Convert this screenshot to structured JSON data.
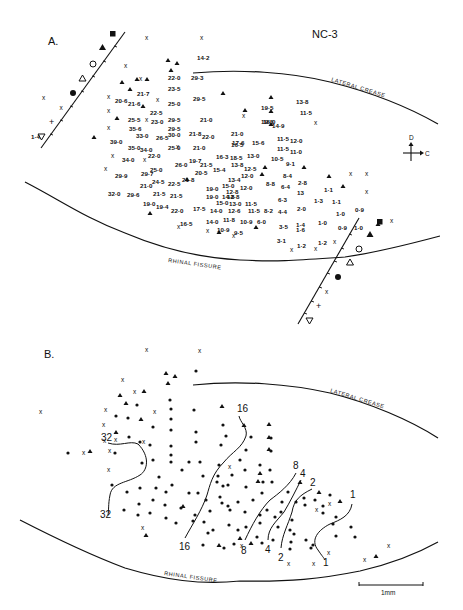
{
  "figure": {
    "id_label": "NC-3",
    "panels": [
      {
        "label": "A.",
        "landmarks": [
          "LATERAL CREASE",
          "RHINAL FISSURE"
        ],
        "orientation": {
          "up": "D",
          "right": "C"
        },
        "electrode_track_markers": [
          "filled-square",
          "filled-triangle",
          "open-circle",
          "open-triangle",
          "filled-circle",
          "x",
          "+",
          "open-inverted-triangle"
        ],
        "point_legend": {
          "x": "unresponsive site",
          "A": "auditory-responsive site"
        }
      },
      {
        "label": "B.",
        "landmarks": [
          "LATERAL CREASE",
          "RHINAL FISSURE"
        ],
        "isofrequency_labels": [
          "32",
          "16",
          "8",
          "4",
          "2",
          "1"
        ],
        "scale_bar": "1mm"
      }
    ]
  },
  "panelA": {
    "label": "A.",
    "title": "NC-3",
    "lateral_crease": "LATERAL CREASE",
    "rhinal_fissure": "RHINAL FISSURE",
    "orient_d": "D",
    "orient_c": "C",
    "values": [
      {
        "x": 197,
        "y": 60,
        "t": "14·2"
      },
      {
        "x": 168,
        "y": 80,
        "t": "22·0"
      },
      {
        "x": 191,
        "y": 80,
        "t": "29·3"
      },
      {
        "x": 168,
        "y": 91,
        "t": "23·5"
      },
      {
        "x": 137,
        "y": 96,
        "t": "21·7"
      },
      {
        "x": 115,
        "y": 103,
        "t": "20·6"
      },
      {
        "x": 128,
        "y": 106,
        "t": "21·6"
      },
      {
        "x": 168,
        "y": 106,
        "t": "25·0"
      },
      {
        "x": 193,
        "y": 101,
        "t": "29·5"
      },
      {
        "x": 150,
        "y": 115,
        "t": "22·5"
      },
      {
        "x": 261,
        "y": 110,
        "t": "19·5"
      },
      {
        "x": 296,
        "y": 104,
        "t": "13·8"
      },
      {
        "x": 128,
        "y": 122,
        "t": "25·5"
      },
      {
        "x": 151,
        "y": 124,
        "t": "23·0"
      },
      {
        "x": 168,
        "y": 122,
        "t": "29·5"
      },
      {
        "x": 200,
        "y": 122,
        "t": "21·0"
      },
      {
        "x": 261,
        "y": 124,
        "t": "19·5"
      },
      {
        "x": 300,
        "y": 115,
        "t": "11·5"
      },
      {
        "x": 168,
        "y": 131,
        "t": "29·5"
      },
      {
        "x": 129,
        "y": 131,
        "t": "35·6"
      },
      {
        "x": 136,
        "y": 138,
        "t": "33·0"
      },
      {
        "x": 156,
        "y": 140,
        "t": "26·5"
      },
      {
        "x": 168,
        "y": 137,
        "t": "30·0"
      },
      {
        "x": 189,
        "y": 136,
        "t": "21·8"
      },
      {
        "x": 202,
        "y": 139,
        "t": "22·0"
      },
      {
        "x": 231,
        "y": 136,
        "t": "21·0"
      },
      {
        "x": 263,
        "y": 124,
        "t": "18·0"
      },
      {
        "x": 272,
        "y": 128,
        "t": "14·9"
      },
      {
        "x": 110,
        "y": 144,
        "t": "39·0"
      },
      {
        "x": 232,
        "y": 145,
        "t": "17·6"
      },
      {
        "x": 252,
        "y": 145,
        "t": "15·6"
      },
      {
        "x": 277,
        "y": 141,
        "t": "11·5"
      },
      {
        "x": 290,
        "y": 143,
        "t": "12·0"
      },
      {
        "x": 128,
        "y": 150,
        "t": "35·0"
      },
      {
        "x": 140,
        "y": 152,
        "t": "34·0"
      },
      {
        "x": 168,
        "y": 150,
        "t": "25·0"
      },
      {
        "x": 193,
        "y": 150,
        "t": "21·0"
      },
      {
        "x": 231,
        "y": 147,
        "t": "16·5"
      },
      {
        "x": 277,
        "y": 151,
        "t": "11·5"
      },
      {
        "x": 290,
        "y": 154,
        "t": "11·0"
      },
      {
        "x": 148,
        "y": 158,
        "t": "22·0"
      },
      {
        "x": 122,
        "y": 162,
        "t": "34·0"
      },
      {
        "x": 216,
        "y": 159,
        "t": "16·3"
      },
      {
        "x": 230,
        "y": 160,
        "t": "18·5"
      },
      {
        "x": 247,
        "y": 158,
        "t": "13·0"
      },
      {
        "x": 189,
        "y": 163,
        "t": "19·7"
      },
      {
        "x": 175,
        "y": 167,
        "t": "26·0"
      },
      {
        "x": 200,
        "y": 167,
        "t": "21·5"
      },
      {
        "x": 271,
        "y": 161,
        "t": "10·5"
      },
      {
        "x": 286,
        "y": 166,
        "t": "9·1"
      },
      {
        "x": 150,
        "y": 172,
        "t": "25·0"
      },
      {
        "x": 231,
        "y": 167,
        "t": "13·8"
      },
      {
        "x": 244,
        "y": 171,
        "t": "12·5"
      },
      {
        "x": 115,
        "y": 178,
        "t": "29·9"
      },
      {
        "x": 141,
        "y": 176,
        "t": "29·7"
      },
      {
        "x": 213,
        "y": 172,
        "t": "15·4"
      },
      {
        "x": 195,
        "y": 175,
        "t": "20·5"
      },
      {
        "x": 241,
        "y": 178,
        "t": "12·0"
      },
      {
        "x": 283,
        "y": 178,
        "t": "8·4"
      },
      {
        "x": 152,
        "y": 184,
        "t": "24·5"
      },
      {
        "x": 168,
        "y": 186,
        "t": "22·5"
      },
      {
        "x": 182,
        "y": 182,
        "t": "21·8"
      },
      {
        "x": 228,
        "y": 182,
        "t": "13·4"
      },
      {
        "x": 298,
        "y": 185,
        "t": "2·8"
      },
      {
        "x": 140,
        "y": 188,
        "t": "21·0"
      },
      {
        "x": 206,
        "y": 191,
        "t": "19·0"
      },
      {
        "x": 222,
        "y": 188,
        "t": "15·0"
      },
      {
        "x": 240,
        "y": 190,
        "t": "12·0"
      },
      {
        "x": 226,
        "y": 194,
        "t": "12·8"
      },
      {
        "x": 266,
        "y": 186,
        "t": "8·8"
      },
      {
        "x": 281,
        "y": 189,
        "t": "6·4"
      },
      {
        "x": 108,
        "y": 196,
        "t": "32·0"
      },
      {
        "x": 127,
        "y": 197,
        "t": "29·6"
      },
      {
        "x": 153,
        "y": 196,
        "t": "21·5"
      },
      {
        "x": 170,
        "y": 198,
        "t": "21·5"
      },
      {
        "x": 206,
        "y": 199,
        "t": "19·0"
      },
      {
        "x": 222,
        "y": 199,
        "t": "14·8"
      },
      {
        "x": 227,
        "y": 199,
        "t": "12·8"
      },
      {
        "x": 297,
        "y": 195,
        "t": "13"
      },
      {
        "x": 143,
        "y": 206,
        "t": "19·0"
      },
      {
        "x": 156,
        "y": 209,
        "t": "19·4"
      },
      {
        "x": 216,
        "y": 205,
        "t": "15·0"
      },
      {
        "x": 229,
        "y": 206,
        "t": "13·0"
      },
      {
        "x": 245,
        "y": 206,
        "t": "11·5"
      },
      {
        "x": 278,
        "y": 202,
        "t": "6·3"
      },
      {
        "x": 171,
        "y": 213,
        "t": "22·0"
      },
      {
        "x": 193,
        "y": 211,
        "t": "17·5"
      },
      {
        "x": 210,
        "y": 213,
        "t": "14·0"
      },
      {
        "x": 228,
        "y": 213,
        "t": "12·6"
      },
      {
        "x": 248,
        "y": 213,
        "t": "11·5"
      },
      {
        "x": 264,
        "y": 213,
        "t": "8·2"
      },
      {
        "x": 278,
        "y": 214,
        "t": "4·4"
      },
      {
        "x": 297,
        "y": 211,
        "t": "2·0"
      },
      {
        "x": 180,
        "y": 226,
        "t": "16·5"
      },
      {
        "x": 206,
        "y": 224,
        "t": "14·0"
      },
      {
        "x": 223,
        "y": 222,
        "t": "11·8"
      },
      {
        "x": 240,
        "y": 224,
        "t": "10·9"
      },
      {
        "x": 257,
        "y": 224,
        "t": "6·0"
      },
      {
        "x": 217,
        "y": 232,
        "t": "10·9"
      },
      {
        "x": 234,
        "y": 235,
        "t": "9·5"
      },
      {
        "x": 279,
        "y": 229,
        "t": "3·5"
      },
      {
        "x": 296,
        "y": 227,
        "t": "1·4"
      },
      {
        "x": 296,
        "y": 232,
        "t": "1·6"
      },
      {
        "x": 277,
        "y": 243,
        "t": "3·1"
      },
      {
        "x": 297,
        "y": 248,
        "t": "1·2"
      },
      {
        "x": 318,
        "y": 245,
        "t": "1·2"
      },
      {
        "x": 318,
        "y": 225,
        "t": "1·0"
      },
      {
        "x": 336,
        "y": 216,
        "t": "1·0"
      },
      {
        "x": 338,
        "y": 230,
        "t": "0·9"
      },
      {
        "x": 355,
        "y": 212,
        "t": "0·9"
      },
      {
        "x": 354,
        "y": 230,
        "t": "1·0"
      },
      {
        "x": 324,
        "y": 192,
        "t": "1·1"
      },
      {
        "x": 314,
        "y": 203,
        "t": "1·3"
      },
      {
        "x": 332,
        "y": 204,
        "t": "1·1"
      },
      {
        "x": 31,
        "y": 139,
        "t": "1·4"
      }
    ],
    "x_marks": [
      [
        145,
        40
      ],
      [
        200,
        40
      ],
      [
        42,
        100
      ],
      [
        124,
        68
      ],
      [
        139,
        81
      ],
      [
        156,
        102
      ],
      [
        107,
        99
      ],
      [
        107,
        113
      ],
      [
        107,
        130
      ],
      [
        145,
        122
      ],
      [
        111,
        158
      ],
      [
        143,
        162
      ],
      [
        104,
        171
      ],
      [
        176,
        149
      ],
      [
        242,
        118
      ],
      [
        314,
        125
      ],
      [
        349,
        176
      ],
      [
        365,
        176
      ],
      [
        365,
        194
      ],
      [
        177,
        229
      ],
      [
        206,
        233
      ],
      [
        232,
        238
      ],
      [
        290,
        252
      ],
      [
        314,
        251
      ],
      [
        333,
        244
      ],
      [
        390,
        223
      ]
    ],
    "a_marks": [
      [
        168,
        62
      ],
      [
        177,
        65
      ],
      [
        171,
        72
      ],
      [
        122,
        84
      ],
      [
        130,
        91
      ],
      [
        147,
        81
      ],
      [
        94,
        139
      ],
      [
        117,
        120
      ],
      [
        143,
        108
      ],
      [
        223,
        95
      ],
      [
        245,
        112
      ],
      [
        271,
        99
      ],
      [
        271,
        113
      ],
      [
        271,
        126
      ],
      [
        265,
        169
      ],
      [
        262,
        176
      ],
      [
        304,
        169
      ],
      [
        329,
        178
      ],
      [
        343,
        188
      ],
      [
        150,
        215
      ],
      [
        187,
        181
      ],
      [
        256,
        229
      ],
      [
        219,
        234
      ],
      [
        378,
        226
      ],
      [
        137,
        81
      ]
    ]
  },
  "panelB": {
    "label": "B.",
    "lateral_crease": "LATERAL CREASE",
    "rhinal_fissure": "RHINAL FISSURE",
    "iso_labels": [
      {
        "x": 101,
        "y": 441,
        "t": "32"
      },
      {
        "x": 100,
        "y": 518,
        "t": "32"
      },
      {
        "x": 237,
        "y": 412,
        "t": "16"
      },
      {
        "x": 179,
        "y": 550,
        "t": "16"
      },
      {
        "x": 293,
        "y": 469,
        "t": "8"
      },
      {
        "x": 241,
        "y": 554,
        "t": "8"
      },
      {
        "x": 300,
        "y": 477,
        "t": "4"
      },
      {
        "x": 265,
        "y": 553,
        "t": "4"
      },
      {
        "x": 310,
        "y": 486,
        "t": "2"
      },
      {
        "x": 278,
        "y": 561,
        "t": "2"
      },
      {
        "x": 350,
        "y": 498,
        "t": "1"
      },
      {
        "x": 323,
        "y": 566,
        "t": "1"
      }
    ],
    "scale_bar": "1mm"
  }
}
